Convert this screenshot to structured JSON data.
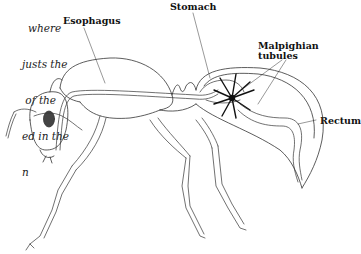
{
  "caption": {
    "lines": [
      "where",
      "justs the",
      " of the",
      "ed in the",
      "n"
    ]
  },
  "labels": {
    "esophagus": "Esophagus",
    "stomach": "Stomach",
    "malpighian_1": "Malpighian",
    "malpighian_2": "tubules",
    "rectum": "Rectum"
  },
  "colors": {
    "line": "#333333",
    "eye": "#444444"
  }
}
